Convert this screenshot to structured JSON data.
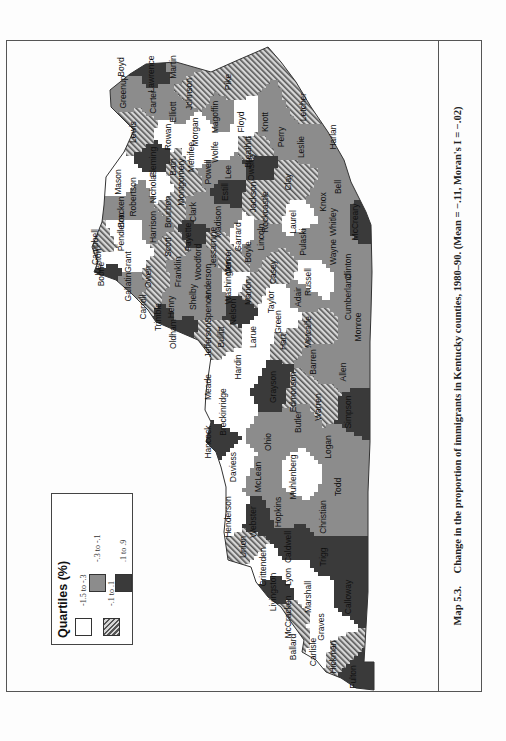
{
  "figure": {
    "label": "Map 5.3.",
    "caption": "Change in the proportion of immigrants in Kentucky counties, 1980–90. (Mean = −.11, Moran's I = −.02)"
  },
  "legend": {
    "title": "Quartiles (%)",
    "items": [
      {
        "label": "-1.5 to -.3",
        "fill": "#ffffff"
      },
      {
        "label": "-.3 to -.1",
        "fill": "#8c8c8c"
      },
      {
        "label": "-.1 to .1",
        "fill": "hatched"
      },
      {
        "label": ".1 to .9",
        "fill": "#3a3a3a"
      }
    ]
  },
  "colors": {
    "q1": "#ffffff",
    "q2": "#8c8c8c",
    "q3_hatch_dark": "#555555",
    "q3_hatch_light": "#d6d6d6",
    "q4": "#3a3a3a",
    "border": "#444444"
  },
  "counties": [
    {
      "name": "Pike",
      "u": 610,
      "v": 225,
      "q": 3
    },
    {
      "name": "Floyd",
      "u": 570,
      "v": 238,
      "q": 1
    },
    {
      "name": "Martin",
      "u": 625,
      "v": 170,
      "q": 2
    },
    {
      "name": "Johnson",
      "u": 598,
      "v": 186,
      "q": 3
    },
    {
      "name": "Lawrence",
      "u": 618,
      "v": 148,
      "q": 4
    },
    {
      "name": "Boyd",
      "u": 625,
      "v": 118,
      "q": 4
    },
    {
      "name": "Greenup",
      "u": 600,
      "v": 120,
      "q": 2
    },
    {
      "name": "Carter",
      "u": 590,
      "v": 150,
      "q": 2
    },
    {
      "name": "Elliott",
      "u": 580,
      "v": 170,
      "q": 2
    },
    {
      "name": "Lewis",
      "u": 560,
      "v": 130,
      "q": 3
    },
    {
      "name": "Rowan",
      "u": 555,
      "v": 165,
      "q": 1
    },
    {
      "name": "Morgan",
      "u": 560,
      "v": 192,
      "q": 1
    },
    {
      "name": "Magoffin",
      "u": 575,
      "v": 212,
      "q": 2
    },
    {
      "name": "Knott",
      "u": 570,
      "v": 262,
      "q": 2
    },
    {
      "name": "Letcher",
      "u": 585,
      "v": 300,
      "q": 3
    },
    {
      "name": "Perry",
      "u": 555,
      "v": 278,
      "q": 2
    },
    {
      "name": "Leslie",
      "u": 545,
      "v": 298,
      "q": 2
    },
    {
      "name": "Harlan",
      "u": 555,
      "v": 330,
      "q": 2
    },
    {
      "name": "Breathitt",
      "u": 540,
      "v": 245,
      "q": 3
    },
    {
      "name": "Wolfe",
      "u": 540,
      "v": 212,
      "q": 1
    },
    {
      "name": "Menifee",
      "u": 535,
      "v": 188,
      "q": 1
    },
    {
      "name": "Fleming",
      "u": 530,
      "v": 150,
      "q": 4
    },
    {
      "name": "Bath",
      "u": 525,
      "v": 170,
      "q": 3
    },
    {
      "name": "Mason",
      "u": 510,
      "v": 115,
      "q": 1
    },
    {
      "name": "Robertson",
      "u": 495,
      "v": 130,
      "q": 2
    },
    {
      "name": "Bracken",
      "u": 480,
      "v": 118,
      "q": 2
    },
    {
      "name": "Nicholas",
      "u": 505,
      "v": 150,
      "q": 1
    },
    {
      "name": "Montgomery",
      "u": 510,
      "v": 178,
      "q": 3
    },
    {
      "name": "Powell",
      "u": 520,
      "v": 205,
      "q": 2
    },
    {
      "name": "Lee",
      "u": 520,
      "v": 225,
      "q": 2
    },
    {
      "name": "Owsley",
      "u": 525,
      "v": 248,
      "q": 4
    },
    {
      "name": "Clay",
      "u": 510,
      "v": 285,
      "q": 3
    },
    {
      "name": "Bell",
      "u": 505,
      "v": 335,
      "q": 2
    },
    {
      "name": "Knox",
      "u": 490,
      "v": 320,
      "q": 2
    },
    {
      "name": "Whitley",
      "u": 470,
      "v": 330,
      "q": 2
    },
    {
      "name": "Laurel",
      "u": 470,
      "v": 290,
      "q": 1
    },
    {
      "name": "Jackson",
      "u": 495,
      "v": 250,
      "q": 3
    },
    {
      "name": "Estill",
      "u": 500,
      "v": 222,
      "q": 4
    },
    {
      "name": "Clark",
      "u": 480,
      "v": 190,
      "q": 2
    },
    {
      "name": "Bourbon",
      "u": 480,
      "v": 165,
      "q": 3
    },
    {
      "name": "Harrison",
      "u": 465,
      "v": 150,
      "q": 2
    },
    {
      "name": "Pendleton",
      "u": 460,
      "v": 118,
      "q": 1
    },
    {
      "name": "Campbell",
      "u": 445,
      "v": 92,
      "q": 3
    },
    {
      "name": "Kenton",
      "u": 430,
      "v": 95,
      "q": 1
    },
    {
      "name": "Boone",
      "u": 418,
      "v": 98,
      "q": 4
    },
    {
      "name": "Grant",
      "u": 430,
      "v": 125,
      "q": 1
    },
    {
      "name": "Gallatin",
      "u": 405,
      "v": 125,
      "q": 2
    },
    {
      "name": "Owen",
      "u": 415,
      "v": 145,
      "q": 3
    },
    {
      "name": "Carroll",
      "u": 385,
      "v": 140,
      "q": 3
    },
    {
      "name": "Trimble",
      "u": 375,
      "v": 155,
      "q": 4
    },
    {
      "name": "Henry",
      "u": 385,
      "v": 168,
      "q": 2
    },
    {
      "name": "Oldham",
      "u": 358,
      "v": 170,
      "q": 4
    },
    {
      "name": "Scott",
      "u": 445,
      "v": 165,
      "q": 3
    },
    {
      "name": "Fayette",
      "u": 455,
      "v": 185,
      "q": 4
    },
    {
      "name": "Franklin",
      "u": 420,
      "v": 175,
      "q": 2
    },
    {
      "name": "Shelby",
      "u": 395,
      "v": 190,
      "q": 2
    },
    {
      "name": "Woodford",
      "u": 430,
      "v": 195,
      "q": 2
    },
    {
      "name": "Madison",
      "u": 470,
      "v": 215,
      "q": 2
    },
    {
      "name": "Jessamine",
      "u": 445,
      "v": 210,
      "q": 3
    },
    {
      "name": "Anderson",
      "u": 410,
      "v": 205,
      "q": 2
    },
    {
      "name": "Mercer",
      "u": 430,
      "v": 225,
      "q": 3
    },
    {
      "name": "Garrard",
      "u": 455,
      "v": 235,
      "q": 1
    },
    {
      "name": "Boyle",
      "u": 440,
      "v": 245,
      "q": 2
    },
    {
      "name": "Rockcastle",
      "u": 480,
      "v": 262,
      "q": 3
    },
    {
      "name": "Lincoln",
      "u": 455,
      "v": 258,
      "q": 2
    },
    {
      "name": "Pulaski",
      "u": 450,
      "v": 300,
      "q": 2
    },
    {
      "name": "McCreary",
      "u": 470,
      "v": 352,
      "q": 4
    },
    {
      "name": "Wayne",
      "u": 440,
      "v": 330,
      "q": 2
    },
    {
      "name": "Casey",
      "u": 420,
      "v": 270,
      "q": 3
    },
    {
      "name": "Russell",
      "u": 410,
      "v": 305,
      "q": 1
    },
    {
      "name": "Clinton",
      "u": 425,
      "v": 345,
      "q": 2
    },
    {
      "name": "Cumberland",
      "u": 395,
      "v": 345,
      "q": 2
    },
    {
      "name": "Adair",
      "u": 395,
      "v": 295,
      "q": 2
    },
    {
      "name": "Taylor",
      "u": 390,
      "v": 268,
      "q": 1
    },
    {
      "name": "Green",
      "u": 370,
      "v": 275,
      "q": 1
    },
    {
      "name": "Marion",
      "u": 400,
      "v": 245,
      "q": 3
    },
    {
      "name": "Washington",
      "u": 410,
      "v": 225,
      "q": 1
    },
    {
      "name": "Spencer",
      "u": 385,
      "v": 205,
      "q": 2
    },
    {
      "name": "Jefferson",
      "u": 352,
      "v": 205,
      "q": 3
    },
    {
      "name": "Nelson",
      "u": 380,
      "v": 230,
      "q": 4
    },
    {
      "name": "Bullitt",
      "u": 355,
      "v": 218,
      "q": 3
    },
    {
      "name": "Larue",
      "u": 355,
      "v": 250,
      "q": 1
    },
    {
      "name": "Hardin",
      "u": 325,
      "v": 235,
      "q": 1
    },
    {
      "name": "Meade",
      "u": 305,
      "v": 205,
      "q": 1
    },
    {
      "name": "Hart",
      "u": 350,
      "v": 280,
      "q": 3
    },
    {
      "name": "Metcalfe",
      "u": 360,
      "v": 305,
      "q": 3
    },
    {
      "name": "Monroe",
      "u": 365,
      "v": 355,
      "q": 2
    },
    {
      "name": "Barren",
      "u": 330,
      "v": 310,
      "q": 2
    },
    {
      "name": "Allen",
      "u": 320,
      "v": 340,
      "q": 2
    },
    {
      "name": "Grayson",
      "u": 305,
      "v": 270,
      "q": 4
    },
    {
      "name": "Edmonson",
      "u": 300,
      "v": 290,
      "q": 3
    },
    {
      "name": "Warren",
      "u": 285,
      "v": 315,
      "q": 3
    },
    {
      "name": "Simpson",
      "u": 280,
      "v": 345,
      "q": 4
    },
    {
      "name": "Breckinridge",
      "u": 280,
      "v": 220,
      "q": 1
    },
    {
      "name": "Hancock",
      "u": 250,
      "v": 205,
      "q": 4
    },
    {
      "name": "Ohio",
      "u": 250,
      "v": 265,
      "q": 2
    },
    {
      "name": "Butler",
      "u": 270,
      "v": 295,
      "q": 2
    },
    {
      "name": "Logan",
      "u": 245,
      "v": 325,
      "q": 2
    },
    {
      "name": "Daviess",
      "u": 225,
      "v": 230,
      "q": 1
    },
    {
      "name": "McLean",
      "u": 215,
      "v": 255,
      "q": 2
    },
    {
      "name": "Muhlenberg",
      "u": 215,
      "v": 290,
      "q": 1
    },
    {
      "name": "Todd",
      "u": 205,
      "v": 335,
      "q": 2
    },
    {
      "name": "Henderson",
      "u": 175,
      "v": 225,
      "q": 1
    },
    {
      "name": "Webster",
      "u": 170,
      "v": 250,
      "q": 4
    },
    {
      "name": "Hopkins",
      "u": 180,
      "v": 275,
      "q": 2
    },
    {
      "name": "Christian",
      "u": 175,
      "v": 320,
      "q": 2
    },
    {
      "name": "Union",
      "u": 145,
      "v": 240,
      "q": 3
    },
    {
      "name": "Caldwell",
      "u": 145,
      "v": 285,
      "q": 4
    },
    {
      "name": "Crittenden",
      "u": 125,
      "v": 260,
      "q": 1
    },
    {
      "name": "Lyon",
      "u": 115,
      "v": 285,
      "q": 1
    },
    {
      "name": "Trigg",
      "u": 135,
      "v": 320,
      "q": 4
    },
    {
      "name": "Livingston",
      "u": 100,
      "v": 270,
      "q": 4
    },
    {
      "name": "Marshall",
      "u": 95,
      "v": 305,
      "q": 1
    },
    {
      "name": "Calloway",
      "u": 95,
      "v": 345,
      "q": 4
    },
    {
      "name": "McCracken",
      "u": 75,
      "v": 285,
      "q": 3
    },
    {
      "name": "Graves",
      "u": 65,
      "v": 318,
      "q": 1
    },
    {
      "name": "Ballard",
      "u": 45,
      "v": 290,
      "q": 3
    },
    {
      "name": "Carlisle",
      "u": 40,
      "v": 310,
      "q": 1
    },
    {
      "name": "Hickman",
      "u": 35,
      "v": 330,
      "q": 3
    },
    {
      "name": "Fulton",
      "u": 15,
      "v": 350,
      "q": 4
    }
  ]
}
